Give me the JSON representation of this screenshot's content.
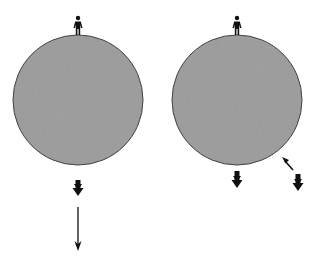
{
  "diagram": {
    "background": "#ffffff",
    "planet_fill": "#9a9a9a",
    "planet_stroke": "#3a3a3a",
    "ink": "#111111",
    "panels": [
      {
        "id": "left",
        "planet": {
          "cx": 78,
          "cy": 100,
          "r": 65
        },
        "figures": [
          {
            "type": "person",
            "x": 78,
            "y": 16,
            "label": "person-on-top"
          }
        ],
        "arrows": [
          {
            "type": "thick-down",
            "x": 78,
            "y": 179,
            "len": 20
          },
          {
            "type": "thin-down",
            "x": 78,
            "y": 207,
            "len": 44
          }
        ]
      },
      {
        "id": "right",
        "planet": {
          "cx": 237,
          "cy": 100,
          "r": 65
        },
        "figures": [
          {
            "type": "person",
            "x": 237,
            "y": 16,
            "label": "person-on-top"
          }
        ],
        "arrows": [
          {
            "type": "thick-down",
            "x": 237,
            "y": 171,
            "len": 20
          },
          {
            "type": "thick-down",
            "x": 298,
            "y": 173,
            "len": 20
          },
          {
            "type": "pointer",
            "x1": 294,
            "y1": 169,
            "x2": 283,
            "y2": 158
          }
        ]
      }
    ]
  }
}
